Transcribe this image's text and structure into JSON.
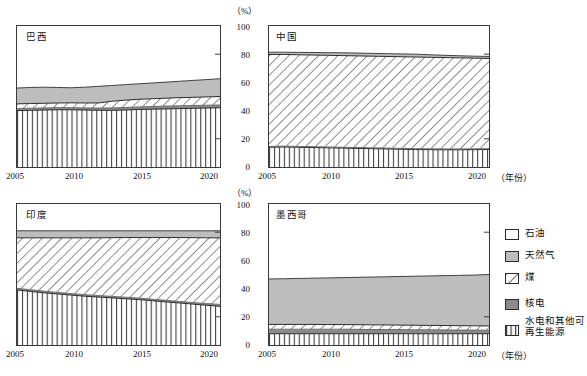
{
  "axis": {
    "y_unit": "（%）",
    "y_ticks": [
      "100",
      "80",
      "60",
      "40",
      "20",
      "0"
    ],
    "x_ticks": [
      "2005",
      "2010",
      "2015",
      "2020"
    ],
    "x_unit": "（年份）"
  },
  "panels": {
    "brazil": {
      "title": "巴西"
    },
    "china": {
      "title": "中国"
    },
    "india": {
      "title": "印度"
    },
    "mexico": {
      "title": "墨西哥"
    }
  },
  "legend": {
    "items": [
      {
        "label": "石油",
        "key": "oil",
        "color": "#ffffff"
      },
      {
        "label": "天然气",
        "key": "gas",
        "color": "#bdbdbd"
      },
      {
        "label": "煤",
        "key": "coal",
        "color": "hatch-diagonal"
      },
      {
        "label": "核电",
        "key": "nuclear",
        "color": "#8a8a8a"
      },
      {
        "label": "水电和其他可再生能源",
        "key": "renewables",
        "color": "hatch-vertical"
      }
    ]
  },
  "chart_data": {
    "type": "area",
    "title": "",
    "xlabel": "（年份）",
    "ylabel": "（%）",
    "xlim": [
      2005,
      2020
    ],
    "ylim": [
      0,
      100
    ],
    "grid": false,
    "stacked": true,
    "legend_position": "right-bottom",
    "x": [
      2005,
      2006,
      2007,
      2008,
      2009,
      2010,
      2011,
      2012,
      2013,
      2014,
      2015,
      2016,
      2017,
      2018,
      2019,
      2020
    ],
    "series_order": [
      "renewables",
      "nuclear",
      "coal",
      "gas",
      "oil"
    ],
    "series_style": {
      "renewables": "vertical-hatch",
      "nuclear": "solid-dark-gray",
      "coal": "diagonal-hatch",
      "gas": "solid-light-gray",
      "oil": "white"
    },
    "panels": [
      {
        "name": "巴西",
        "name_en": "Brazil",
        "cumulative_tops": {
          "renewables": [
            40.0,
            40.2,
            40.4,
            40.6,
            40.6,
            40.4,
            40.2,
            40.2,
            40.4,
            40.8,
            41.0,
            41.2,
            41.4,
            41.6,
            41.8,
            42.0
          ],
          "nuclear": [
            41.5,
            41.7,
            41.9,
            42.1,
            42.1,
            41.9,
            41.8,
            41.9,
            42.2,
            42.6,
            42.9,
            43.2,
            43.4,
            43.6,
            43.8,
            44.0
          ],
          "coal": [
            44.8,
            45.0,
            45.2,
            45.4,
            45.5,
            45.4,
            45.4,
            46.6,
            47.4,
            48.0,
            48.4,
            48.8,
            49.2,
            49.4,
            49.7,
            50.0
          ],
          "gas": [
            47.0,
            47.2,
            47.4,
            47.6,
            47.8,
            47.8,
            48.0,
            49.4,
            50.2,
            50.8,
            51.2,
            51.6,
            52.0,
            52.3,
            52.7,
            53.0
          ],
          "oil": [
            100,
            100,
            100,
            100,
            100,
            100,
            100,
            100,
            100,
            100,
            100,
            100,
            100,
            100,
            100,
            100
          ]
        },
        "top_of_gas_outline": [
          56.0,
          56.4,
          56.6,
          56.4,
          56.2,
          56.6,
          57.2,
          57.8,
          58.4,
          59.0,
          59.6,
          60.2,
          60.8,
          61.4,
          62.0,
          62.6
        ]
      },
      {
        "name": "中国",
        "name_en": "China",
        "cumulative_tops": {
          "renewables": [
            14.0,
            14.2,
            14.0,
            13.8,
            13.6,
            13.4,
            13.2,
            13.0,
            12.8,
            12.6,
            12.4,
            12.3,
            12.2,
            12.2,
            12.3,
            12.4
          ],
          "nuclear": [
            14.6,
            14.8,
            14.6,
            14.4,
            14.2,
            14.0,
            13.8,
            13.6,
            13.4,
            13.2,
            13.0,
            12.9,
            12.8,
            12.8,
            12.9,
            13.0
          ],
          "coal": [
            79.8,
            79.8,
            79.6,
            79.4,
            79.2,
            79.0,
            78.8,
            78.6,
            78.4,
            78.2,
            78.0,
            77.8,
            77.6,
            77.4,
            77.2,
            77.0
          ],
          "gas": [
            81.4,
            81.4,
            81.3,
            81.2,
            81.1,
            81.0,
            80.8,
            80.6,
            80.4,
            80.2,
            80.0,
            79.6,
            79.2,
            78.9,
            78.6,
            78.4
          ],
          "oil": [
            100,
            100,
            100,
            100,
            100,
            100,
            100,
            100,
            100,
            100,
            100,
            100,
            100,
            100,
            100,
            100
          ]
        }
      },
      {
        "name": "印度",
        "name_en": "India",
        "cumulative_tops": {
          "renewables": [
            39.0,
            38.0,
            37.0,
            36.2,
            35.4,
            34.6,
            34.0,
            33.4,
            32.8,
            32.2,
            31.4,
            30.6,
            29.8,
            29.0,
            28.2,
            27.4
          ],
          "nuclear": [
            40.2,
            39.2,
            38.2,
            37.3,
            36.5,
            35.7,
            35.1,
            34.5,
            33.9,
            33.3,
            32.5,
            31.7,
            30.9,
            30.1,
            29.4,
            28.8
          ],
          "coal": [
            76.0,
            76.0,
            76.0,
            76.0,
            76.0,
            76.0,
            76.0,
            76.1,
            76.2,
            76.2,
            76.2,
            76.2,
            76.2,
            76.1,
            76.0,
            76.0
          ],
          "gas": [
            81.0,
            81.0,
            81.0,
            81.0,
            81.0,
            81.0,
            81.0,
            81.0,
            81.0,
            81.0,
            81.0,
            81.0,
            81.0,
            81.0,
            81.0,
            81.0
          ],
          "oil": [
            100,
            100,
            100,
            100,
            100,
            100,
            100,
            100,
            100,
            100,
            100,
            100,
            100,
            100,
            100,
            100
          ]
        }
      },
      {
        "name": "墨西哥",
        "name_en": "Mexico",
        "cumulative_tops": {
          "renewables": [
            8.0,
            8.0,
            8.0,
            8.0,
            8.0,
            8.0,
            8.0,
            8.0,
            8.0,
            8.0,
            8.0,
            8.0,
            8.0,
            8.0,
            8.0,
            8.0
          ],
          "nuclear": [
            11.2,
            11.2,
            11.2,
            11.2,
            11.2,
            11.2,
            11.1,
            11.0,
            11.0,
            10.9,
            10.8,
            10.8,
            10.7,
            10.6,
            10.6,
            10.5
          ],
          "coal": [
            14.6,
            14.6,
            14.6,
            14.6,
            14.5,
            14.5,
            14.4,
            14.3,
            14.2,
            14.1,
            14.0,
            13.9,
            13.8,
            13.7,
            13.6,
            13.5
          ],
          "gas": [
            20.6,
            20.6,
            20.5,
            20.5,
            20.4,
            20.3,
            20.2,
            20.1,
            20.0,
            19.9,
            19.8,
            19.6,
            19.4,
            19.2,
            19.0,
            18.8
          ],
          "oil": [
            100,
            100,
            100,
            100,
            100,
            100,
            100,
            100,
            100,
            100,
            100,
            100,
            100,
            100,
            100,
            100
          ]
        },
        "top_of_gas_outline": [
          46.8,
          47.0,
          47.2,
          47.4,
          47.6,
          47.8,
          48.0,
          48.2,
          48.4,
          48.6,
          48.8,
          49.0,
          49.2,
          49.4,
          49.6,
          50.0
        ]
      }
    ]
  }
}
